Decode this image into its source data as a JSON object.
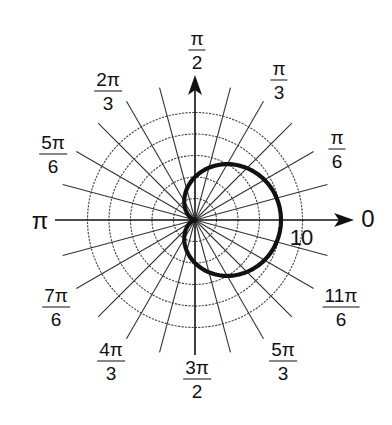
{
  "chart_data": {
    "type": "line",
    "subtype": "polar",
    "title": "",
    "curve": {
      "name": "cardioid",
      "equation": "r = 5 + 5cos(θ)",
      "a": 5,
      "color": "#111111",
      "samples": [
        {
          "theta_deg": 0,
          "r": 10.0
        },
        {
          "theta_deg": 30,
          "r": 9.33
        },
        {
          "theta_deg": 60,
          "r": 7.5
        },
        {
          "theta_deg": 90,
          "r": 5.0
        },
        {
          "theta_deg": 120,
          "r": 2.5
        },
        {
          "theta_deg": 150,
          "r": 0.67
        },
        {
          "theta_deg": 180,
          "r": 0.0
        },
        {
          "theta_deg": 210,
          "r": 0.67
        },
        {
          "theta_deg": 240,
          "r": 2.5
        },
        {
          "theta_deg": 270,
          "r": 5.0
        },
        {
          "theta_deg": 300,
          "r": 7.5
        },
        {
          "theta_deg": 330,
          "r": 9.33
        },
        {
          "theta_deg": 360,
          "r": 10.0
        }
      ]
    },
    "radial_axis": {
      "rings": [
        2.5,
        5,
        7.5,
        10,
        12.5
      ],
      "labeled_ring": {
        "value": 10,
        "label": "10"
      },
      "rmax": 12.5
    },
    "angular_axis": {
      "spoke_step_deg": 15,
      "ticks": [
        {
          "deg": 0,
          "num": "0",
          "den": ""
        },
        {
          "deg": 30,
          "num": "π",
          "den": "6"
        },
        {
          "deg": 60,
          "num": "π",
          "den": "3"
        },
        {
          "deg": 90,
          "num": "π",
          "den": "2"
        },
        {
          "deg": 120,
          "num": "2π",
          "den": "3"
        },
        {
          "deg": 150,
          "num": "5π",
          "den": "6"
        },
        {
          "deg": 180,
          "num": "π",
          "den": ""
        },
        {
          "deg": 210,
          "num": "7π",
          "den": "6"
        },
        {
          "deg": 240,
          "num": "4π",
          "den": "3"
        },
        {
          "deg": 270,
          "num": "3π",
          "den": "2"
        },
        {
          "deg": 300,
          "num": "5π",
          "den": "3"
        },
        {
          "deg": 330,
          "num": "11π",
          "den": "6"
        }
      ]
    },
    "grid": true,
    "legend": null
  },
  "labels": {
    "zero": "0",
    "pi": "π",
    "ring10": "10",
    "pi_over_6": {
      "num": "π",
      "den": "6"
    },
    "pi_over_3": {
      "num": "π",
      "den": "3"
    },
    "pi_over_2": {
      "num": "π",
      "den": "2"
    },
    "two_pi_over_3": {
      "num": "2π",
      "den": "3"
    },
    "five_pi_over_6": {
      "num": "5π",
      "den": "6"
    },
    "seven_pi_over_6": {
      "num": "7π",
      "den": "6"
    },
    "four_pi_over_3": {
      "num": "4π",
      "den": "3"
    },
    "three_pi_over_2": {
      "num": "3π",
      "den": "2"
    },
    "five_pi_over_3": {
      "num": "5π",
      "den": "3"
    },
    "eleven_pi_over_6": {
      "num": "11π",
      "den": "6"
    }
  }
}
